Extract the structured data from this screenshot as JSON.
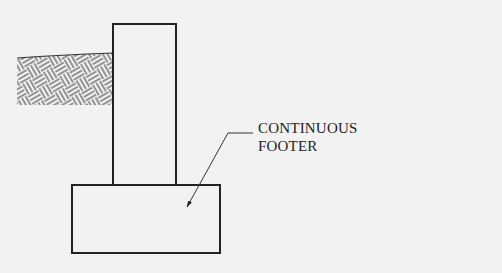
{
  "diagram": {
    "type": "foundation-section",
    "elements": [
      {
        "id": "soil",
        "label": "Soil (earth hatch)"
      },
      {
        "id": "wall",
        "label": "Foundation wall"
      },
      {
        "id": "footer",
        "label": "Continuous footer"
      }
    ],
    "callout": {
      "line1": "CONTINUOUS",
      "line2": "FOOTER",
      "target": "footer"
    },
    "colors": {
      "background": "#f2f2f2",
      "stroke": "#222222"
    }
  }
}
